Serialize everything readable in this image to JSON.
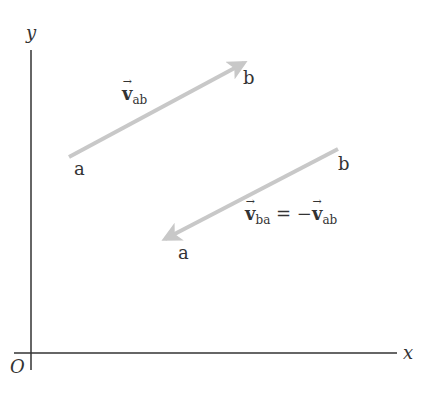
{
  "axes": {
    "x_label": "x",
    "y_label": "y",
    "origin_label": "O",
    "axis_color": "#333333"
  },
  "vectors": [
    {
      "name": "v_ab",
      "symbol": "v",
      "subscript": "ab",
      "tail_label": "a",
      "head_label": "b",
      "color": "#c8c8c8"
    },
    {
      "name": "v_ba",
      "symbol": "v",
      "subscript": "ba",
      "equals": " = −",
      "rhs_symbol": "v",
      "rhs_subscript": "ab",
      "tail_label": "b",
      "head_label": "a",
      "color": "#c8c8c8"
    }
  ]
}
